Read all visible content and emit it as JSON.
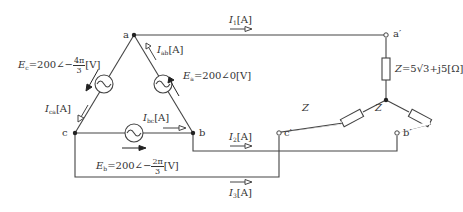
{
  "diagram": {
    "type": "three-phase circuit: delta source to star (Y) load",
    "nodes": {
      "a": "a",
      "b": "b",
      "c": "c",
      "a_prime": "a′",
      "b_prime": "b′",
      "c_prime": "c′"
    },
    "sources": {
      "Ea": {
        "symbol": "E",
        "sub": "a",
        "value": "=200∠0",
        "unit": "[V]"
      },
      "Eb": {
        "symbol": "E",
        "sub": "b",
        "value": "=200∠−",
        "num": "2π",
        "den": "3",
        "unit": "[V]"
      },
      "Ec": {
        "symbol": "E",
        "sub": "c",
        "value": "=200∠−",
        "num": "4π",
        "den": "3",
        "unit": "[V]"
      }
    },
    "currents": {
      "Iab": {
        "symbol": "I",
        "sub": "ab",
        "unit": "[A]"
      },
      "Ibc": {
        "symbol": "I",
        "sub": "bc",
        "unit": "[A]"
      },
      "Ica": {
        "symbol": "I",
        "sub": "ca",
        "unit": "[A]"
      },
      "I1": {
        "symbol": "I",
        "sub": "1",
        "unit": "[A]"
      },
      "I2": {
        "symbol": "I",
        "sub": "2",
        "unit": "[A]"
      },
      "I3": {
        "symbol": "I",
        "sub": "3",
        "unit": "[A]"
      }
    },
    "load": {
      "symbol": "Z",
      "value": "=5√3+j5",
      "unit": "[Ω]"
    },
    "colors": {
      "line": "#444444",
      "text": "#333333",
      "background": "#ffffff"
    }
  }
}
